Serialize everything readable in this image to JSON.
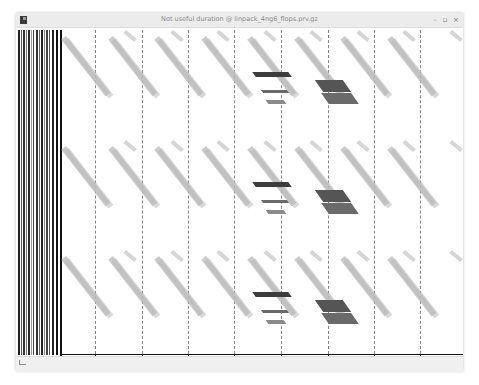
{
  "window": {
    "title": "Not useful duration @ linpack_4ng6_flops.prv.gz",
    "controls": {
      "minimize": "–",
      "maximize": "▫",
      "close": "×"
    }
  },
  "timeline": {
    "view_type": "trace timeline",
    "x_axis": {
      "unit": "ns",
      "tick_labels": [
        "974686688,46 ns",
        "988724616,26 ns",
        "996895963,49 ns",
        "1047783634,74 ns",
        "1636235267,01 ns",
        "1639340631,22 ns",
        "1658760074,54 ns",
        "1654713257,86 ns"
      ]
    },
    "colors": {
      "background": "#ffffff",
      "light_burst": "#b9b9b9",
      "dark_burst": "#3c3c3c",
      "medium_burst": "#6a6a6a",
      "axis": "#111111",
      "gridline": "#888888"
    }
  }
}
